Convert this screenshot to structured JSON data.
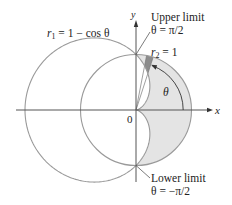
{
  "figure": {
    "type": "polar-area-diagram",
    "origin_px": [
      136,
      110
    ],
    "unit_px": 55.5,
    "colors": {
      "curve": "#9a9a9a",
      "axis": "#555555",
      "shaded_region": "#e4e4e4",
      "sector": "#8c8c8c",
      "text": "#222222"
    }
  },
  "curves": {
    "r1": {
      "equation": "r1 = 1 − cos θ",
      "lhs": "r",
      "sub": "1",
      "rhs": " = 1 − cos θ"
    },
    "r2": {
      "equation": "r2 = 1",
      "lhs": "r",
      "sub": "2",
      "rhs": " = 1"
    }
  },
  "axes": {
    "x_label": "x",
    "y_label": "y",
    "origin_label": "0"
  },
  "annotations": {
    "theta": "θ",
    "upper_limit": {
      "title": "Upper limit",
      "value": "θ = π/2"
    },
    "lower_limit": {
      "title": "Lower limit",
      "value": "θ = −π/2"
    }
  }
}
